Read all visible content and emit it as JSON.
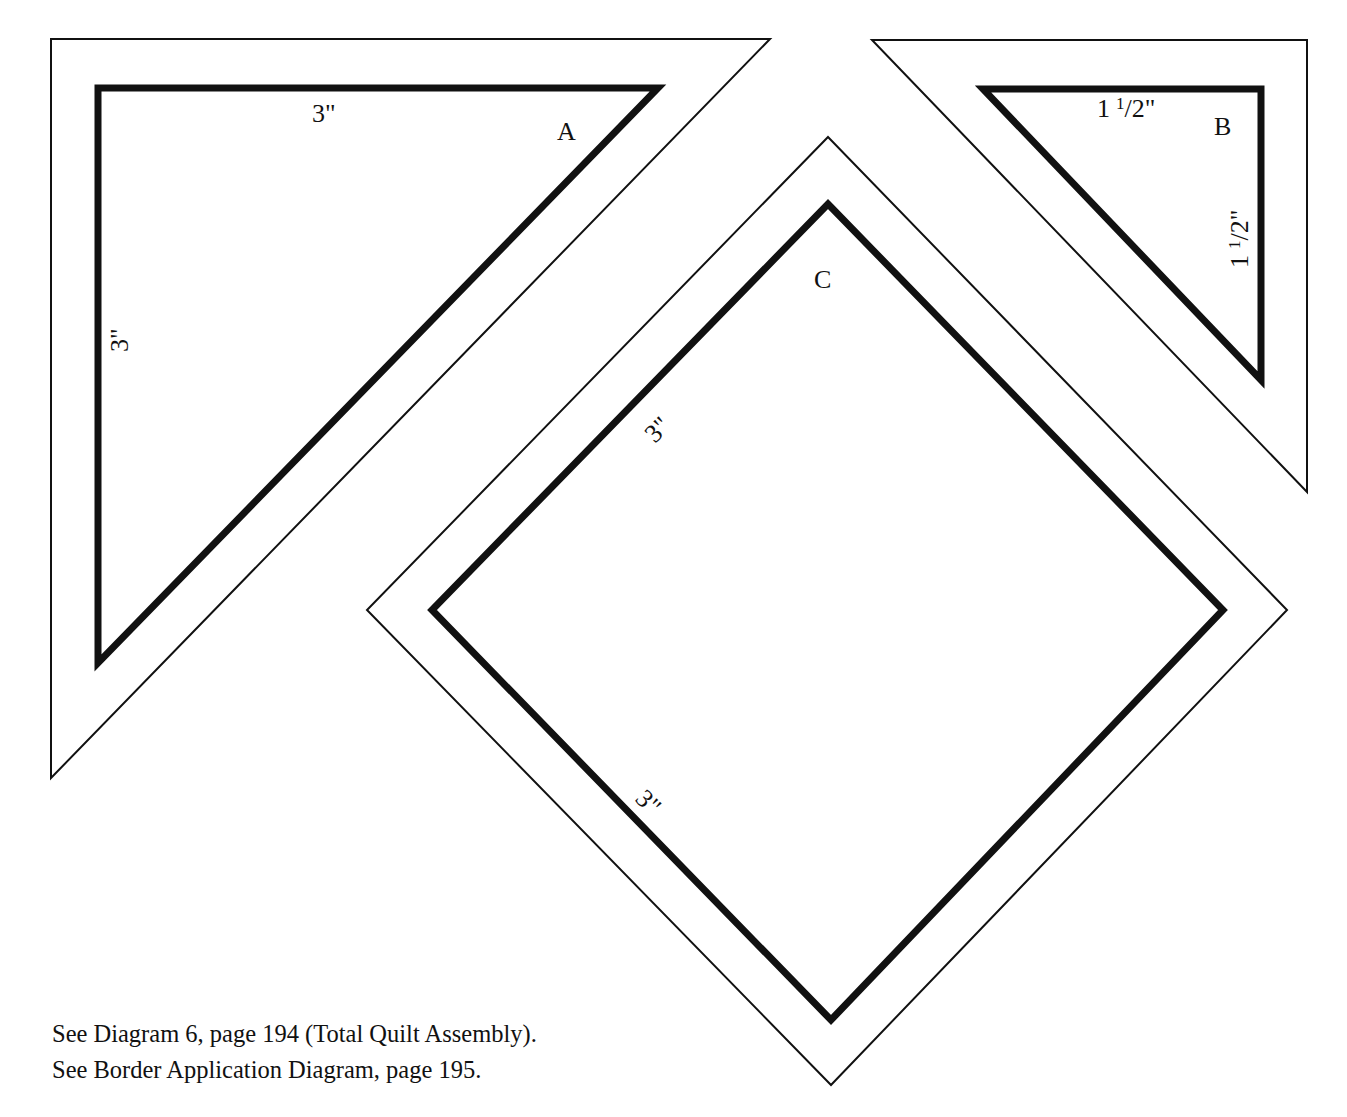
{
  "pieces": {
    "A": {
      "letter": "A",
      "top_dim": "3\"",
      "left_dim": "3\""
    },
    "B": {
      "letter": "B",
      "top_dim_whole": "1",
      "top_dim_frac_num": "1",
      "top_dim_frac_den": "/2\"",
      "right_dim_whole": "1",
      "right_dim_frac_num": "1",
      "right_dim_frac_den": "/2\""
    },
    "C": {
      "letter": "C",
      "upper_left_dim": "3\"",
      "lower_left_dim": "3\""
    }
  },
  "captions": [
    "See Diagram 6, page 194 (Total Quilt Assembly).",
    "See Border Application Diagram, page 195."
  ],
  "colors": {
    "ink": "#111111",
    "paper": "#ffffff"
  }
}
